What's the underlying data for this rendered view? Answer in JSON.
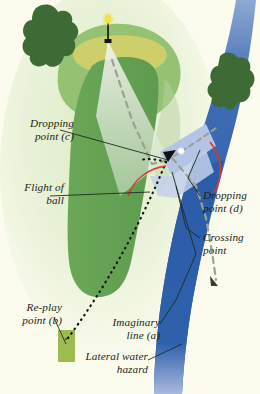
{
  "diagram": {
    "width": 260,
    "height": 394,
    "background_color": "#fbfbee"
  },
  "labels": [
    {
      "name": "dropping-point-c",
      "lines": [
        "Dropping",
        "point (c)"
      ],
      "x": 2,
      "y": 118,
      "align": "left",
      "font_size": 11.2
    },
    {
      "name": "flight-of-ball",
      "lines": [
        "Flight of",
        "ball"
      ],
      "x": 2,
      "y": 182,
      "align": "left",
      "font_size": 11.2
    },
    {
      "name": "re-play-point-b",
      "lines": [
        "Re-play",
        "point (b)"
      ],
      "x": 8,
      "y": 302,
      "align": "left",
      "font_size": 11.2
    },
    {
      "name": "imaginary-line-a",
      "lines": [
        "Imaginary",
        "line (a)"
      ],
      "x": 104,
      "y": 318,
      "align": "left",
      "font_size": 11.2
    },
    {
      "name": "lateral-water-hazard",
      "lines": [
        "Lateral water",
        "hazard"
      ],
      "x": 88,
      "y": 352,
      "align": "left",
      "font_size": 11.2
    },
    {
      "name": "dropping-point-d",
      "lines": [
        "Dropping",
        "point (d)"
      ],
      "x": 203,
      "y": 190,
      "align": "left",
      "font_size": 11.2
    },
    {
      "name": "crossing-point",
      "lines": [
        "Crossing",
        "point"
      ],
      "x": 203,
      "y": 232,
      "align": "left",
      "font_size": 11.2
    }
  ],
  "features": {
    "rough_glow": "#eef5dd",
    "fairway_color": "#63a052",
    "fairway_light": "#9dc48a",
    "green_color": "#7fb45f",
    "green_apron": "#c9cf6a",
    "water_color": "#2a5ca8",
    "water_highlight": "#b3c4e6",
    "tree_color": "#3e6b35",
    "tee_color": "#9dbb4f",
    "flag_color": "#f2e14a",
    "flag_pole_color": "#1a1a1a",
    "ball_color": "#ffffff",
    "arc_color": "#d6392b",
    "leader_color": "#1d2b1d",
    "dotted_color": "#111111",
    "dashed_color": "#9aa48c"
  },
  "markers": {
    "flag": {
      "name": "flag-marker",
      "x": 108,
      "y": 20
    },
    "hole": {
      "name": "hole-marker",
      "x": 108,
      "y": 41
    },
    "ball": {
      "name": "ball-marker",
      "x": 181,
      "y": 152
    },
    "crossing_arrow": {
      "name": "crossing-arrow",
      "x": 171,
      "y": 158
    },
    "imaginary_arrow": {
      "name": "imaginary-line-arrow",
      "x": 215,
      "y": 283
    },
    "tee_box": {
      "name": "tee-box",
      "x": 58,
      "y": 330
    }
  }
}
